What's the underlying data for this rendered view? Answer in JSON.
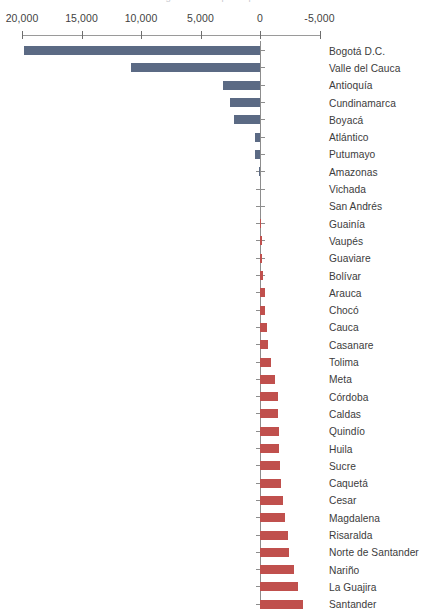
{
  "title_clipped": "Saldo migratorio neto por departamento",
  "chart_data": {
    "type": "bar",
    "orientation": "horizontal",
    "title": "",
    "xlabel": "",
    "ylabel": "",
    "grid": false,
    "legend": "none",
    "axis_position": "top",
    "axis_reversed": true,
    "xlim": [
      20000,
      -5000
    ],
    "xticks": [
      20000,
      15000,
      10000,
      5000,
      0,
      -5000
    ],
    "xtick_labels": [
      "20,000",
      "15,000",
      "10,000",
      "5,000",
      "0",
      "-5,000"
    ],
    "colors": {
      "positive": "#5B6A84",
      "negative": "#C0504D",
      "axis": "#8D8D8D",
      "text": "#3C3C3C"
    },
    "categories": [
      "Bogotá D.C.",
      "Valle del Cauca",
      "Antioquía",
      "Cundinamarca",
      "Boyacá",
      "Atlántico",
      "Putumayo",
      "Amazonas",
      "Vichada",
      "San Andrés",
      "Guainía",
      "Vaupés",
      "Guaviare",
      "Bolívar",
      "Arauca",
      "Chocó",
      "Cauca",
      "Casanare",
      "Tolima",
      "Meta",
      "Córdoba",
      "Caldas",
      "Quindío",
      "Huila",
      "Sucre",
      "Caquetá",
      "Cesar",
      "Magdalena",
      "Risaralda",
      "Norte de Santander",
      "Nariño",
      "La Guajira",
      "Santander"
    ],
    "values": [
      19850,
      10850,
      3080,
      2560,
      2180,
      450,
      420,
      60,
      20,
      -20,
      -90,
      -140,
      -190,
      -250,
      -390,
      -440,
      -560,
      -690,
      -900,
      -1290,
      -1480,
      -1520,
      -1560,
      -1620,
      -1680,
      -1760,
      -1960,
      -2060,
      -2360,
      -2420,
      -2830,
      -3180,
      -3600
    ]
  }
}
